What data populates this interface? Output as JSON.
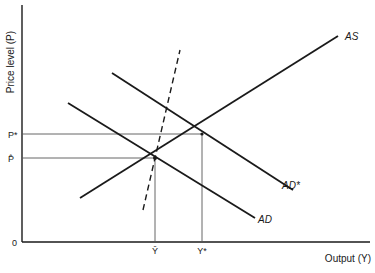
{
  "diagram": {
    "type": "AS-AD macroeconomic diagram",
    "y_axis_label": "Price level (P)",
    "x_axis_label": "Output (Y)",
    "origin_label": "0",
    "price_labels": {
      "p_star": "P*",
      "p_hat": "P̂"
    },
    "output_labels": {
      "y_hat": "Ŷ",
      "y_star": "Y*"
    },
    "curves": [
      {
        "id": "AS",
        "label": "AS",
        "style": "solid"
      },
      {
        "id": "AD",
        "label": "AD",
        "style": "solid"
      },
      {
        "id": "AD_star",
        "label": "AD*",
        "style": "solid"
      },
      {
        "id": "vertical_dashed",
        "label": "",
        "style": "dashed"
      }
    ],
    "equilibria": [
      {
        "name": "initial",
        "price": "P̂",
        "output": "Ŷ"
      },
      {
        "name": "new",
        "price": "P*",
        "output": "Y*"
      }
    ],
    "colors": {
      "line": "#1a1a1a",
      "guide": "#555555",
      "background": "#ffffff"
    }
  }
}
